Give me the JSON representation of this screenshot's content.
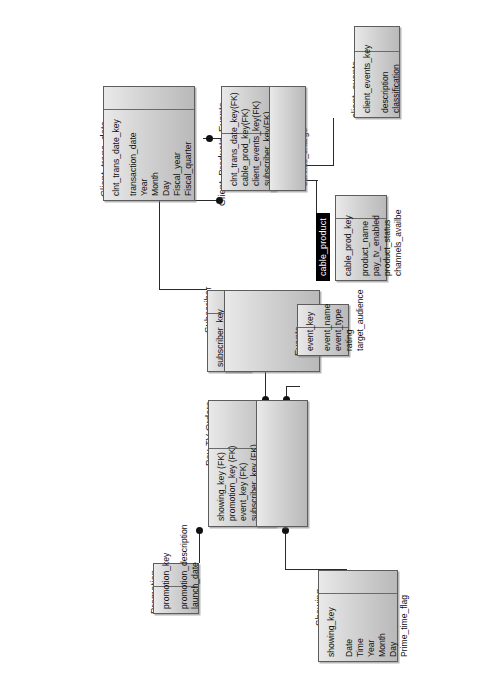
{
  "diagram": {
    "orientation": "rotated-90",
    "entities": [
      {
        "id": "client_trans_date",
        "name": "Client_trans_date",
        "keys": [
          "clnt_trans_date_key"
        ],
        "columns": [
          "transaction_date",
          "Year",
          "Month",
          "Day",
          "Fiscal_year",
          "Fiscal_quarter"
        ]
      },
      {
        "id": "client_products_events",
        "name": "Client_Products_Events",
        "keys": [
          "clnt_trans_date_key(FK)",
          "cable_prod_key(FK)",
          "client_events_key(FK)",
          "subscriber_key(FK)"
        ],
        "columns": [
          "gross_cost",
          "discount",
          "service_charge"
        ]
      },
      {
        "id": "client_events",
        "name": "client_events",
        "keys": [
          "client_events_key"
        ],
        "columns": [
          "description",
          "classification"
        ]
      },
      {
        "id": "cable_product",
        "name": "cable_product",
        "name_style": "black",
        "keys": [
          "cable_prod_key"
        ],
        "columns": [
          "product_name",
          "pay_tv_enabled",
          "product_status",
          "channels_availbe"
        ]
      },
      {
        "id": "subscriber",
        "name": "Subscriber",
        "keys": [
          "subscriber_key"
        ],
        "columns": [
          "customer_code",
          "name",
          "street_address",
          "city",
          "province_state",
          "postal_code",
          "country",
          "cable_profile"
        ]
      },
      {
        "id": "events",
        "name": "Events",
        "keys": [
          "event_key"
        ],
        "columns": [
          "event_name",
          "event_type",
          "rating",
          "target_audience"
        ]
      },
      {
        "id": "paytv_orders",
        "name": "Pay-TV Orders",
        "keys": [
          "showing_key (FK)",
          "promotion_key (FK)",
          "event_key (FK)",
          "subscriber_key (FK)"
        ],
        "columns": [
          "total_cost_of_order",
          "discount",
          "telephone_order_indicator",
          "computer_order_indicator"
        ]
      },
      {
        "id": "promotion",
        "name": "Promotion",
        "keys": [
          "promotion_key"
        ],
        "columns": [
          "promotion_description",
          "launch_date"
        ]
      },
      {
        "id": "showing",
        "name": "Showing",
        "keys": [
          "showing_key"
        ],
        "columns": [
          "Date",
          "Time",
          "Year",
          "Month",
          "Day",
          "Prime_time_flag"
        ]
      }
    ],
    "relationships": [
      {
        "from": "client_trans_date",
        "to": "client_products_events"
      },
      {
        "from": "client_events",
        "to": "client_products_events"
      },
      {
        "from": "cable_product",
        "to": "client_products_events"
      },
      {
        "from": "subscriber",
        "to": "client_products_events"
      },
      {
        "from": "subscriber",
        "to": "paytv_orders"
      },
      {
        "from": "events",
        "to": "paytv_orders"
      },
      {
        "from": "promotion",
        "to": "paytv_orders"
      },
      {
        "from": "showing",
        "to": "paytv_orders"
      }
    ],
    "colors": {
      "box_border": "#5d5d5d",
      "box_fill_light": "#e9e9e9",
      "box_fill_dark": "#b9b9b9",
      "line": "#2a2a2a",
      "black_header": "#000000"
    }
  }
}
